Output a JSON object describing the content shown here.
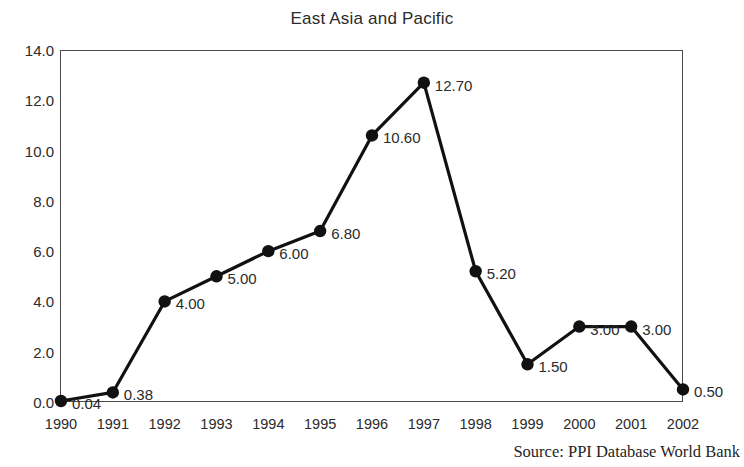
{
  "chart_data": {
    "type": "line",
    "title": "East Asia and Pacific",
    "xlabel": "",
    "ylabel": "",
    "categories": [
      "1990",
      "1991",
      "1992",
      "1993",
      "1994",
      "1995",
      "1996",
      "1997",
      "1998",
      "1999",
      "2000",
      "2001",
      "2002"
    ],
    "values": [
      0.04,
      0.38,
      4.0,
      5.0,
      6.0,
      6.8,
      10.6,
      12.7,
      5.2,
      1.5,
      3.0,
      3.0,
      0.5
    ],
    "point_labels": [
      "0.04",
      "0.38",
      "4.00",
      "5.00",
      "6.00",
      "6.80",
      "10.60",
      "12.70",
      "5.20",
      "1.50",
      "3.00",
      "3.00",
      "0.50"
    ],
    "ylim": [
      0.0,
      14.0
    ],
    "y_ticks": [
      0.0,
      2.0,
      4.0,
      6.0,
      8.0,
      10.0,
      12.0,
      14.0
    ],
    "y_tick_labels": [
      "0.0",
      "2.0",
      "4.0",
      "6.0",
      "8.0",
      "10.0",
      "12.0",
      "14.0"
    ],
    "x_tick_labels": [
      "1990",
      "1991",
      "1992",
      "1993",
      "1994",
      "1995",
      "1996",
      "1997",
      "1998",
      "1999",
      "2000",
      "2001",
      "2002"
    ],
    "grid": false,
    "legend": false,
    "marker": "filled-circle",
    "line_color": "#111111",
    "marker_color": "#111111",
    "frame_color": "#4a4a4a",
    "background_color": "#ffffff",
    "data_labels_shown": true
  },
  "source": {
    "text": "Source: PPI Database World Bank"
  }
}
